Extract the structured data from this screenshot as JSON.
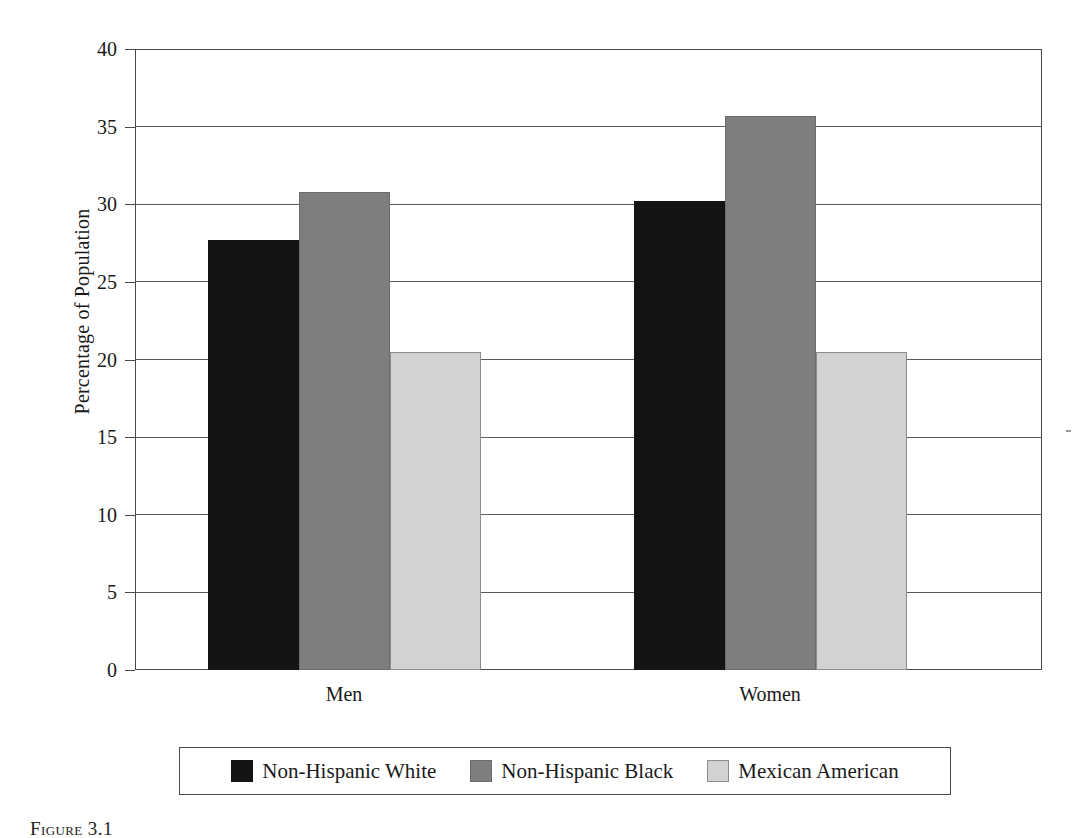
{
  "chart_data": {
    "type": "bar",
    "title": "",
    "xlabel": "",
    "ylabel": "Percentage of Population",
    "categories": [
      "Men",
      "Women"
    ],
    "series": [
      {
        "name": "Non-Hispanic White",
        "color": "#141414",
        "values": [
          27.7,
          30.2
        ]
      },
      {
        "name": "Non-Hispanic Black",
        "color": "#7e7e7e",
        "values": [
          30.8,
          35.7
        ]
      },
      {
        "name": "Mexican American",
        "color": "#d2d2d2",
        "values": [
          20.5,
          20.5
        ]
      }
    ],
    "ylim": [
      0,
      40
    ],
    "ytick_step": 5,
    "ytick_labels": [
      "0",
      "5",
      "10",
      "15",
      "20",
      "25",
      "30",
      "35",
      "40"
    ],
    "ytick_values": [
      0,
      5,
      10,
      15,
      20,
      25,
      30,
      35,
      40
    ],
    "grid": true,
    "grid_axis": "y",
    "legend_position": "bottom"
  },
  "legend": {
    "entries": [
      {
        "label": "Non-Hispanic White",
        "swatch": "black-swatch"
      },
      {
        "label": "Non-Hispanic Black",
        "swatch": "gray-swatch"
      },
      {
        "label": "Mexican American",
        "swatch": "light-gray-swatch"
      }
    ]
  },
  "caption": {
    "text": "Figure 3.1"
  }
}
